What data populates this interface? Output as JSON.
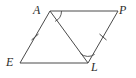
{
  "figure": {
    "kind": "geometry-diagram",
    "background_color": "#ffffff",
    "stroke_color": "#4a4a4a",
    "label_color": "#2b2b2b",
    "stroke_width": 1,
    "vertices": [
      {
        "name": "A",
        "label": "A",
        "x": 50,
        "y": 11,
        "label_x": 33,
        "label_y": 4
      },
      {
        "name": "P",
        "label": "P",
        "x": 118,
        "y": 11,
        "label_x": 119,
        "label_y": 4
      },
      {
        "name": "L",
        "label": "L",
        "x": 88,
        "y": 63,
        "label_x": 91,
        "label_y": 61
      },
      {
        "name": "E",
        "label": "E",
        "x": 20,
        "y": 63,
        "label_x": 6,
        "label_y": 56
      }
    ],
    "edges": [
      {
        "name": "AP",
        "from": "A",
        "to": "P"
      },
      {
        "name": "PL",
        "from": "P",
        "to": "L"
      },
      {
        "name": "LE",
        "from": "L",
        "to": "E"
      },
      {
        "name": "EA",
        "from": "E",
        "to": "A"
      }
    ],
    "diagonal": {
      "name": "AL",
      "from": "A",
      "to": "L"
    },
    "tick_marks": [
      {
        "name": "tick-on-EA",
        "on_edge": "EA",
        "count": 1,
        "x": 35,
        "y": 37
      },
      {
        "name": "tick-on-PL",
        "on_edge": "PL",
        "count": 1,
        "x": 103,
        "y": 37
      }
    ],
    "angle_arcs": [
      {
        "name": "angle-arc-at-A",
        "at_vertex": "A",
        "between": "AP and AL"
      },
      {
        "name": "angle-arc-at-L",
        "at_vertex": "L",
        "between": "LA and LP"
      }
    ]
  }
}
